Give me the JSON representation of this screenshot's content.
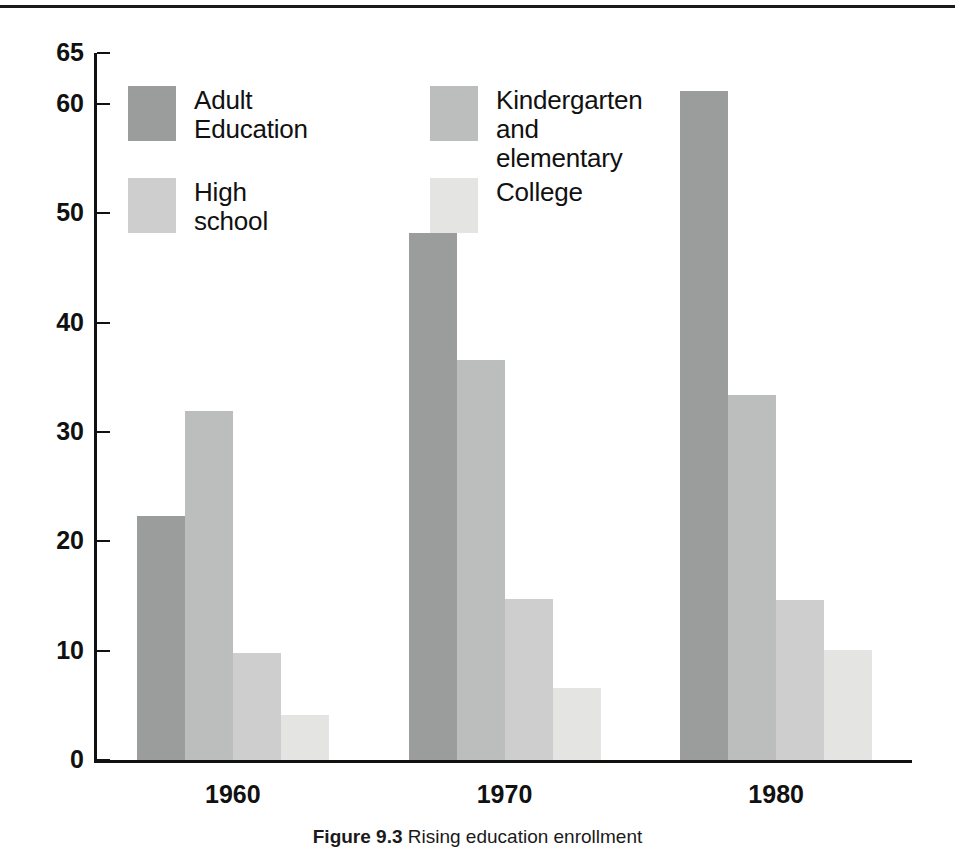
{
  "figure": {
    "caption_label": "Figure 9.3",
    "caption_text": "Rising education enrollment"
  },
  "colors": {
    "adult_education": "#9b9c9c",
    "kindergarten_and_elementary": "#bcbdbd",
    "high_school": "#cdcecd",
    "college": "#e4e4e3",
    "axis": "#111111",
    "background": "#ffffff"
  },
  "legend": {
    "position": "upper-left-inside",
    "entries": [
      {
        "label": "Adult\nEducation",
        "color_key": "adult_education"
      },
      {
        "label": "Kindergarten\nand elementary",
        "color_key": "kindergarten_and_elementary"
      },
      {
        "label": "High\nschool",
        "color_key": "high_school"
      },
      {
        "label": "College",
        "color_key": "college"
      }
    ]
  },
  "chart_data": {
    "type": "bar",
    "title": "",
    "subtitle": "",
    "xlabel": "",
    "ylabel": "",
    "categories": [
      "1960",
      "1970",
      "1980"
    ],
    "series": [
      {
        "name": "Adult Education",
        "values": [
          22.3,
          48.2,
          61.3
        ]
      },
      {
        "name": "Kindergarten and elementary",
        "values": [
          31.9,
          36.6,
          33.4
        ]
      },
      {
        "name": "High school",
        "values": [
          9.8,
          14.7,
          14.6
        ]
      },
      {
        "name": "College",
        "values": [
          4.1,
          6.6,
          10.1
        ]
      }
    ],
    "yticks": [
      0,
      10,
      20,
      30,
      40,
      50,
      60,
      65
    ],
    "ytick_labels": [
      "0",
      "10",
      "20",
      "30",
      "40",
      "50",
      "60",
      "65"
    ],
    "ylim": [
      0,
      65
    ],
    "xtick_labels": [
      "1960",
      "1970",
      "1980"
    ],
    "grid": false,
    "legend_position": "inside upper-left"
  }
}
